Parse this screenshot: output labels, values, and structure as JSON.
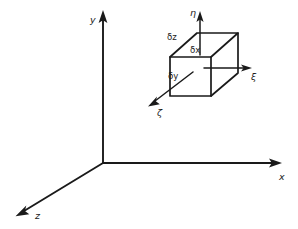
{
  "figure": {
    "background_color": "#ffffff",
    "ink_color": "#1a1a1a"
  },
  "global_axes": {
    "name": "global-cartesian-frame",
    "origin_label": "",
    "axes": [
      {
        "id": "y",
        "label": "y",
        "direction": "up",
        "label_x": 90,
        "label_y": 23
      },
      {
        "id": "x",
        "label": "x",
        "direction": "right",
        "label_x": 279,
        "label_y": 180
      },
      {
        "id": "z",
        "label": "z",
        "direction": "down-left",
        "label_x": 35,
        "label_y": 219
      }
    ]
  },
  "volume_element": {
    "name": "differential-volume-box",
    "edge_labels": [
      {
        "id": "dz",
        "label": "δz",
        "edge": "top-back-left",
        "label_x": 167,
        "label_y": 40
      },
      {
        "id": "dx",
        "label": "δx",
        "edge": "top-front",
        "label_x": 190,
        "label_y": 53
      },
      {
        "id": "dy",
        "label": "δy",
        "edge": "depth-diagonal",
        "label_x": 168,
        "label_y": 79
      }
    ]
  },
  "local_axes": {
    "name": "local-curvilinear-frame",
    "axes": [
      {
        "id": "eta",
        "label": "η",
        "direction": "up",
        "label_x": 190,
        "label_y": 16
      },
      {
        "id": "xi",
        "label": "ξ",
        "direction": "right",
        "label_x": 251,
        "label_y": 80
      },
      {
        "id": "zeta",
        "label": "ζ",
        "direction": "down-left",
        "label_x": 157,
        "label_y": 116
      }
    ]
  }
}
